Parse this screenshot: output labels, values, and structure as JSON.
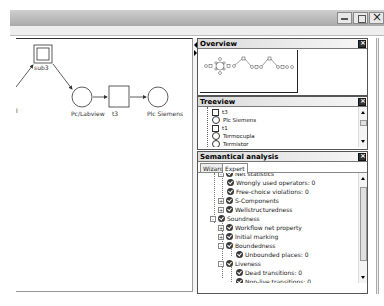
{
  "window": {
    "controls": [
      "minimize",
      "maximize",
      "close"
    ]
  },
  "canvas": {
    "nodes": [
      {
        "id": "sub3",
        "type": "subnet",
        "label": "sub3"
      },
      {
        "id": "pc_labview",
        "type": "place",
        "label": "Pc/Labview"
      },
      {
        "id": "t3",
        "type": "transition",
        "label": "t3"
      },
      {
        "id": "plc_siemens",
        "type": "place",
        "label": "Plc Siemens"
      }
    ],
    "partial_label": "l"
  },
  "overview": {
    "title": "Overview"
  },
  "treeview": {
    "title": "Treeview",
    "items": [
      {
        "label": "t3",
        "shape": "square"
      },
      {
        "label": "Plc Siemens",
        "shape": "circle"
      },
      {
        "label": "t1",
        "shape": "square"
      },
      {
        "label": "Termocupla",
        "shape": "circle"
      },
      {
        "label": "Termistor",
        "shape": "circle"
      }
    ]
  },
  "semantic": {
    "title": "Semantical analysis",
    "tabs": [
      {
        "label": "Wizard",
        "active": false
      },
      {
        "label": "Expert",
        "active": true
      }
    ],
    "items": [
      {
        "label": "Net statistics",
        "level": 2,
        "expander": "-",
        "cut": true
      },
      {
        "label": "Wrongly used operators: 0",
        "level": 3,
        "expander": ""
      },
      {
        "label": "Free-choice violations: 0",
        "level": 3,
        "expander": ""
      },
      {
        "label": "S-Components",
        "level": 2,
        "expander": "+"
      },
      {
        "label": "Wellstructuredness",
        "level": 2,
        "expander": "+"
      },
      {
        "label": "Soundness",
        "level": 1,
        "expander": "-"
      },
      {
        "label": "Workflow net property",
        "level": 2,
        "expander": "+"
      },
      {
        "label": "Initial marking",
        "level": 2,
        "expander": "+"
      },
      {
        "label": "Boundedness",
        "level": 2,
        "expander": "-"
      },
      {
        "label": "Unbounded places: 0",
        "level": 3,
        "expander": ""
      },
      {
        "label": "Liveness",
        "level": 2,
        "expander": "-"
      },
      {
        "label": "Dead transitions: 0",
        "level": 3,
        "expander": ""
      },
      {
        "label": "Non-live transitions: 0",
        "level": 3,
        "expander": ""
      }
    ]
  }
}
